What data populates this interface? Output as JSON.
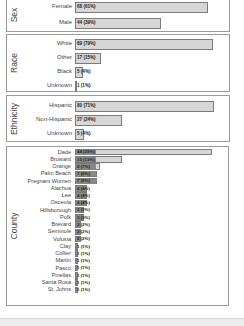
{
  "chart_data": [
    {
      "type": "bar",
      "orientation": "horizontal",
      "title": "Sex",
      "categories": [
        "Female",
        "Male"
      ],
      "values": [
        68,
        44
      ],
      "labels": [
        "68 (61%)",
        "44 (39%)"
      ],
      "percentages": [
        61,
        39
      ]
    },
    {
      "type": "bar",
      "orientation": "horizontal",
      "title": "Race",
      "categories": [
        "White",
        "Other",
        "Black",
        "Unknown"
      ],
      "values": [
        89,
        17,
        5,
        1
      ],
      "labels": [
        "89 (79%)",
        "17 (15%)",
        "5 (4%)",
        "1 (1%)"
      ],
      "percentages": [
        79,
        15,
        4,
        1
      ]
    },
    {
      "type": "bar",
      "orientation": "horizontal",
      "title": "Ethnicity",
      "categories": [
        "Hispanic",
        "Non-Hispanic",
        "Unknown"
      ],
      "values": [
        80,
        27,
        5
      ],
      "labels": [
        "80 (71%)",
        "27 (24%)",
        "5 (4%)"
      ],
      "percentages": [
        71,
        24,
        4
      ]
    },
    {
      "type": "bar",
      "orientation": "horizontal",
      "title": "County",
      "categories": [
        "Dade",
        "Broward",
        "Orange",
        "Palm Beach",
        "Pregnant Women",
        "Alachua",
        "Lee",
        "Osceola",
        "Hillsborough",
        "Polk",
        "Brevard",
        "Seminole",
        "Volusia",
        "Clay",
        "Collier",
        "Martin",
        "Pasco",
        "Pinellas",
        "Santa Rosa",
        "St. Johns"
      ],
      "values": [
        44,
        15,
        8,
        7,
        7,
        4,
        4,
        4,
        3,
        3,
        2,
        2,
        2,
        1,
        1,
        1,
        1,
        1,
        1,
        1
      ],
      "labels": [
        "44 (39%)",
        "15 (13%)",
        "8 (7%)",
        "7 (6%)",
        "7 (6%)",
        "4 (4%)",
        "4 (4%)",
        "4 (4%)",
        "3 (3%)",
        "3 (3%)",
        "2 (2%)",
        "2 (2%)",
        "2 (2%)",
        "1 (1%)",
        "1 (1%)",
        "1 (1%)",
        "1 (1%)",
        "1 (1%)",
        "1 (1%)",
        "1 (1%)"
      ],
      "percentages": [
        39,
        13,
        7,
        6,
        6,
        4,
        4,
        4,
        3,
        3,
        2,
        2,
        2,
        1,
        1,
        1,
        1,
        1,
        1,
        1
      ]
    }
  ],
  "colors": {
    "bar_fill": "#d6d6d6",
    "bar_border": "#7a7a7a",
    "panel_border": "#9a9a9a",
    "label_bg": "#888888"
  }
}
